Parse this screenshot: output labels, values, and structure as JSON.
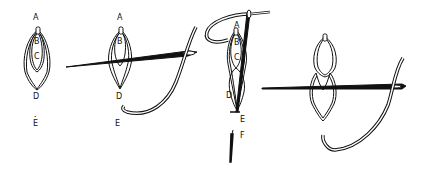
{
  "diagram": {
    "type": "embroidery-stitch-steps",
    "steps": [
      {
        "id": 1,
        "labels": [
          {
            "text": "A",
            "x": 36,
            "y": 18
          },
          {
            "text": "B",
            "x": 36,
            "y": 42
          },
          {
            "text": "C",
            "x": 36,
            "y": 58
          },
          {
            "text": "D",
            "x": 35,
            "y": 94
          },
          {
            "text": "E",
            "x": 35,
            "y": 122
          }
        ]
      },
      {
        "id": 2,
        "labels": [
          {
            "text": "A",
            "x": 119,
            "y": 18
          },
          {
            "text": "B",
            "x": 119,
            "y": 42
          },
          {
            "text": "D",
            "x": 118,
            "y": 94
          },
          {
            "text": "E",
            "x": 117,
            "y": 122
          }
        ]
      },
      {
        "id": 3,
        "labels": [
          {
            "text": "A",
            "x": 236,
            "y": 23
          },
          {
            "text": "B",
            "x": 236,
            "y": 42
          },
          {
            "text": "C",
            "x": 235,
            "y": 58
          },
          {
            "text": "D",
            "x": 229,
            "y": 93
          },
          {
            "text": "E",
            "x": 241,
            "y": 118
          },
          {
            "text": "F",
            "x": 241,
            "y": 134
          }
        ]
      },
      {
        "id": 4,
        "labels": []
      }
    ],
    "colors": {
      "ink": "#111111",
      "paper": "#ffffff"
    }
  }
}
